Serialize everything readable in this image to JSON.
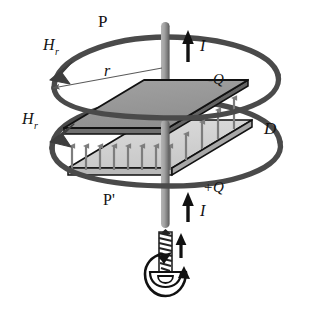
{
  "figure": {
    "background_color": "#ffffff",
    "width": 313,
    "height": 312
  },
  "colors": {
    "loop_stroke": "#4a4a4a",
    "plate_top_fill": "#9a9a9a",
    "plate_bottom_fill": "#d2d2d2",
    "plate_edge": "#111111",
    "rod_fill": "#9e9e9e",
    "rod_shadow": "#5c5c5c",
    "field_arrow": "#7d7d7d",
    "current_arrow": "#111111",
    "radius_line": "#5a5a5a",
    "screw_body": "#2b2b2b",
    "text": "#121212"
  },
  "labels": {
    "loop_upper_name": "P",
    "loop_lower_name": "P'",
    "field_upper": "H",
    "field_upper_sub": "r",
    "field_lower": "H",
    "field_lower_sub": "r",
    "radius": "r",
    "current_top": "I",
    "current_bottom": "I",
    "charge_negative": "-Q",
    "charge_positive": "+Q",
    "displacement": "D"
  },
  "elements": {
    "upper_loop": {
      "name": "amperian-loop-upper",
      "description": "thick elliptical contour P encircling the wire above the capacitor",
      "direction": "counterclockwise-viewed-from-above"
    },
    "lower_loop": {
      "name": "amperian-loop-lower",
      "description": "thick elliptical contour P-prime encircling the capacitor gap",
      "direction": "counterclockwise-viewed-from-above"
    },
    "capacitor": {
      "top_plate_charge": "-Q",
      "bottom_plate_charge": "+Q",
      "field_symbol": "D",
      "field_arrow_count": 12,
      "field_direction": "upward"
    },
    "wire": {
      "current_symbol": "I",
      "current_direction": "upward"
    },
    "screw": {
      "name": "right-hand-rule-screw",
      "rotation": "counterclockwise",
      "advance_direction": "upward",
      "thread_turns": 9
    }
  }
}
